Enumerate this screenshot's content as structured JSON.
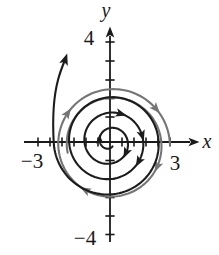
{
  "labels": {
    "y_axis": "y",
    "x_axis": "x",
    "y_max": "4",
    "y_min": "−4",
    "x_min": "−3",
    "x_max": "3"
  },
  "colors": {
    "trajectory_black": "#1c1c1c",
    "trajectory_gray": "#757575",
    "axis": "#1a1a1a",
    "background": "#ffffff"
  },
  "chart_data": {
    "type": "line",
    "subtype": "phase-portrait-spiral",
    "xlabel": "x",
    "ylabel": "y",
    "xlim": [
      -3.6,
      3.8
    ],
    "ylim": [
      -4.4,
      4.7
    ],
    "grid": false,
    "x_labeled_ticks": [
      -3,
      3
    ],
    "y_labeled_ticks": [
      -4,
      4
    ],
    "minor_ticks": "unlabeled hash marks spaced along both axes",
    "series": [
      {
        "name": "black spiral trajectory",
        "color": "#1c1c1c",
        "direction": "clockwise",
        "description": "starts near the origin, winds outward about 3.3 turns (radii ~0.2 to ~2.3 units), then exits upward at the upper left with an arrowhead",
        "arrowheads": 6
      },
      {
        "name": "gray outer trajectory",
        "color": "#757575",
        "direction": "clockwise",
        "description": "outer loop of about 1.5 turns at radius ~2 units, slowly expanding, arrowheads at right, bottom-left, upper-left and top-right",
        "arrowheads": 4
      }
    ]
  },
  "render": {
    "width": 219,
    "height": 255,
    "axes": {
      "origin": [
        110,
        142
      ],
      "x_from": 24,
      "x_to": 190,
      "x_tip": 198,
      "y_from": 242,
      "y_to": 36,
      "y_tip": 28,
      "stroke": 1.8,
      "tick_half": 4.6,
      "tick_stroke": 1.6,
      "x_ticks": [
        38,
        50,
        62,
        74,
        86,
        98,
        122,
        134,
        146,
        158,
        170
      ],
      "y_ticks": [
        42,
        61,
        80,
        98.5,
        117,
        160.5,
        179,
        197.5,
        216,
        234.5
      ]
    },
    "black_spiral": {
      "center": [
        110,
        142
      ],
      "theta0_deg": 60,
      "r0": 5,
      "growth": 2.45,
      "phi_max": 20.944,
      "stroke": 2.1,
      "arrows_phi": [
        2.3,
        5.8,
        10.3,
        11.3,
        12.1
      ],
      "tail": [
        [
          52.5,
          120
        ],
        [
          54,
          95
        ],
        [
          58,
          80
        ],
        [
          60,
          72
        ],
        [
          62.5,
          66
        ],
        [
          65,
          60
        ]
      ],
      "tip_dir": [
        0.32,
        -0.95
      ]
    },
    "gray_spiral": {
      "center": [
        112,
        145
      ],
      "theta0_deg": 170,
      "r0": 45,
      "growth": 1.35,
      "phi_max": 9.6,
      "stroke": 2.1,
      "arrows_phi": [
        3.75,
        5.41,
        7.07,
        8.9
      ]
    }
  }
}
